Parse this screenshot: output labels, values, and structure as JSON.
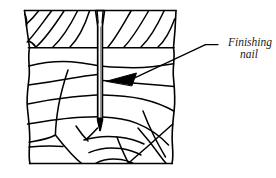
{
  "figure": {
    "type": "technical-line-illustration",
    "background_color": "#ffffff",
    "line_color": "#000000",
    "fill_color": "#ffffff",
    "callout": {
      "line_1": "Finishing",
      "line_2": "nail",
      "full_text": "Finishing nail",
      "style": "italic-serif",
      "text_color": "#1a1a1a",
      "leader_line": {
        "from_x": 218,
        "from_y": 45,
        "elbow_x": 205,
        "elbow_y": 45,
        "to_x": 126,
        "to_y": 80,
        "arrowhead": "filled-triangle-pointing-left"
      }
    },
    "nail": {
      "name": "finishing-nail",
      "head_top_y": 10,
      "tip_y": 130,
      "shaft_center_x": 100,
      "shaft_width": 4.5,
      "head_width": 9,
      "head_taper_bottom_y": 27
    },
    "wood_block": {
      "top_band": {
        "name": "end-grain-hatched-band",
        "top_y": 10,
        "bottom_y": 48,
        "left_x": 24,
        "right_x": 176,
        "hatch_count": 8,
        "hatch_angle_deg": 55
      },
      "lower_section": {
        "name": "wood-grain-section",
        "top_y": 48,
        "bottom_y": 164,
        "left_x": 28,
        "right_x": 173,
        "grain_line_count": 18
      }
    }
  }
}
